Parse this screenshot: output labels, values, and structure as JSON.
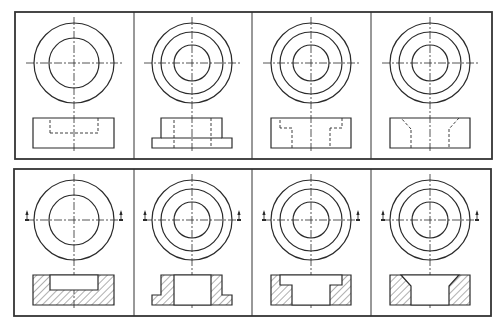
{
  "colors": {
    "line": "#2a2a2a",
    "frame": "#333333",
    "background": "#ffffff",
    "hatch": "#3a3a3a"
  },
  "rows": [
    {
      "name": "views-exterior",
      "frame": {
        "x": 15,
        "y": 12,
        "w": 477,
        "h": 147
      },
      "sectioned": false,
      "cy": 63,
      "front": {
        "top": 118,
        "bottom": 148
      }
    },
    {
      "name": "views-sectioned",
      "frame": {
        "x": 14,
        "y": 169,
        "w": 477,
        "h": 147
      },
      "sectioned": true,
      "cy": 220,
      "front": {
        "top": 275,
        "bottom": 305
      }
    }
  ],
  "dividers": [
    134,
    252,
    371
  ],
  "parts": [
    {
      "name": "blind-pocket-disc",
      "cx": 74,
      "radii": [
        40,
        25
      ],
      "body": [
        [
          33,
          0
        ],
        [
          114,
          0
        ],
        [
          114,
          30
        ],
        [
          33,
          30
        ]
      ],
      "cavity": [
        [
          50,
          0
        ],
        [
          98,
          0
        ],
        [
          98,
          15
        ],
        [
          50,
          15
        ]
      ],
      "cavity_open_top": true,
      "hidden_segments": []
    },
    {
      "name": "flanged-bushing",
      "cx": 192,
      "radii": [
        40,
        31,
        18
      ],
      "body": [
        [
          161,
          0
        ],
        [
          222,
          0
        ],
        [
          222,
          20
        ],
        [
          232,
          20
        ],
        [
          232,
          30
        ],
        [
          152,
          30
        ],
        [
          152,
          20
        ],
        [
          161,
          20
        ]
      ],
      "cavity": [
        [
          174,
          0
        ],
        [
          211,
          0
        ],
        [
          211,
          30
        ],
        [
          174,
          30
        ]
      ],
      "cavity_through": true
    },
    {
      "name": "counterbored-disc",
      "cx": 311,
      "radii": [
        40,
        31,
        18
      ],
      "body": [
        [
          271,
          0
        ],
        [
          351,
          0
        ],
        [
          351,
          30
        ],
        [
          271,
          30
        ]
      ],
      "cavity": [
        [
          280,
          0
        ],
        [
          342,
          0
        ],
        [
          342,
          10
        ],
        [
          330,
          10
        ],
        [
          330,
          30
        ],
        [
          292,
          30
        ],
        [
          292,
          10
        ],
        [
          280,
          10
        ]
      ],
      "cavity_through": true
    },
    {
      "name": "countersunk-disc",
      "cx": 430,
      "radii": [
        40,
        31,
        18
      ],
      "body": [
        [
          390,
          0
        ],
        [
          470,
          0
        ],
        [
          470,
          30
        ],
        [
          390,
          30
        ]
      ],
      "cavity": [
        [
          401,
          0
        ],
        [
          459,
          0
        ],
        [
          449,
          11
        ],
        [
          449,
          30
        ],
        [
          411,
          30
        ],
        [
          411,
          11
        ]
      ],
      "cavity_through": true
    }
  ]
}
